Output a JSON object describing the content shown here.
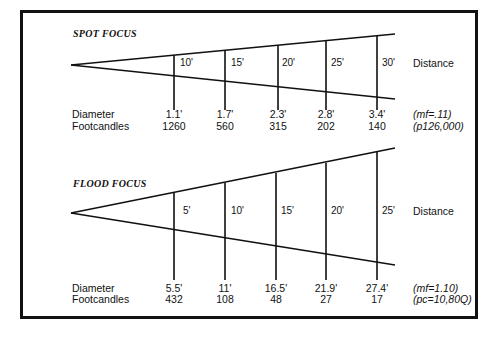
{
  "spot": {
    "title": "SPOT FOCUS",
    "distance_label": "Distance",
    "distances": [
      "10'",
      "15'",
      "20'",
      "25'",
      "30'"
    ],
    "diameter_label": "Diameter",
    "footcandles_label": "Footcandles",
    "diameters": [
      "1.1'",
      "1.7'",
      "2.3'",
      "2.8'",
      "3.4'"
    ],
    "footcandles": [
      "1260",
      "560",
      "315",
      "202",
      "140"
    ],
    "note1": "(mf=.11)",
    "note2": "(p126,000)"
  },
  "flood": {
    "title": "FLOOD FOCUS",
    "distance_label": "Distance",
    "distances": [
      "5'",
      "10'",
      "15'",
      "20'",
      "25'"
    ],
    "diameter_label": "Diameter",
    "footcandles_label": "Footcandles",
    "diameters": [
      "5.5'",
      "11'",
      "16.5'",
      "21.9'",
      "27.4'"
    ],
    "footcandles": [
      "432",
      "108",
      "48",
      "27",
      "17"
    ],
    "note1": "(mf=1.10)",
    "note2": "(pc=10,80Q)"
  }
}
